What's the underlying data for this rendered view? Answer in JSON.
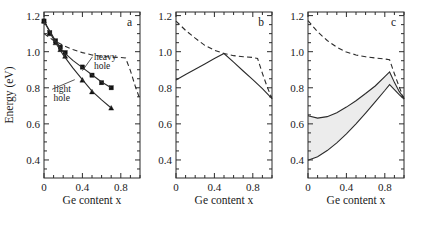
{
  "figure": {
    "background_color": "#ffffff",
    "ink_color": "#2b2b2b",
    "band_fill_color": "#ececec"
  },
  "chart_data": [
    {
      "type": "scatter",
      "panel": "a",
      "panel_label": "a",
      "title": "",
      "xlabel": "Ge content x",
      "ylabel": "Energy (eV)",
      "xlim": [
        0,
        1.0
      ],
      "ylim": [
        0.3,
        1.22
      ],
      "xticks": [
        0,
        0.4,
        0.8
      ],
      "xticklabels": [
        "0",
        "0.4",
        "0.8"
      ],
      "yticks": [
        0.4,
        0.6,
        0.8,
        1.0,
        1.2
      ],
      "yticklabels": [
        "0.4",
        "0.6",
        "0.8",
        "1.0",
        "1.2"
      ],
      "grid": false,
      "legend": "inline-annotations",
      "annotations": [
        {
          "text": "heavy hole",
          "x": 0.52,
          "y": 0.955,
          "points_to_x": 0.4,
          "points_to_y": 0.895
        },
        {
          "text": "light hole",
          "x": 0.1,
          "y": 0.775,
          "points_to_x": 0.32,
          "points_to_y": 0.845
        }
      ],
      "series": [
        {
          "name": "heavy hole data",
          "style": "markers",
          "marker": "filled-square",
          "x": [
            0.0,
            0.06,
            0.12,
            0.17,
            0.22,
            0.4,
            0.5,
            0.6,
            0.7
          ],
          "y": [
            1.17,
            1.105,
            1.06,
            1.025,
            0.995,
            0.915,
            0.87,
            0.828,
            0.8
          ]
        },
        {
          "name": "light hole data",
          "style": "markers",
          "marker": "filled-triangle",
          "x": [
            0.0,
            0.06,
            0.12,
            0.17,
            0.22,
            0.4,
            0.5,
            0.7
          ],
          "y": [
            1.17,
            1.1,
            1.05,
            1.012,
            0.975,
            0.843,
            0.778,
            0.688
          ]
        },
        {
          "name": "heavy hole fit",
          "style": "solid",
          "x": [
            0.0,
            0.1,
            0.2,
            0.3,
            0.4,
            0.5,
            0.6,
            0.7
          ],
          "y": [
            1.17,
            1.078,
            1.0,
            0.952,
            0.912,
            0.872,
            0.832,
            0.8
          ]
        },
        {
          "name": "light hole fit",
          "style": "solid",
          "x": [
            0.0,
            0.1,
            0.2,
            0.3,
            0.4,
            0.5,
            0.6,
            0.7
          ],
          "y": [
            1.17,
            1.068,
            0.982,
            0.91,
            0.845,
            0.782,
            0.733,
            0.688
          ]
        },
        {
          "name": "unstrained indirect gap",
          "style": "dashed",
          "x": [
            0.0,
            0.1,
            0.2,
            0.3,
            0.4,
            0.5,
            0.6,
            0.7,
            0.8,
            0.85,
            0.9,
            0.95,
            1.0
          ],
          "y": [
            1.1,
            1.062,
            1.035,
            1.012,
            0.995,
            0.982,
            0.975,
            0.97,
            0.968,
            0.965,
            0.895,
            0.81,
            0.735
          ]
        }
      ]
    },
    {
      "type": "line",
      "panel": "b",
      "panel_label": "b",
      "title": "",
      "xlabel": "Ge content x",
      "ylabel": "",
      "xlim": [
        0,
        1.0
      ],
      "ylim": [
        0.3,
        1.22
      ],
      "xticks": [
        0,
        0.4,
        0.8
      ],
      "xticklabels": [
        "0",
        "0.4",
        "0.8"
      ],
      "yticks": [
        0.4,
        0.6,
        0.8,
        1.0,
        1.2
      ],
      "yticklabels": [
        "0.4",
        "0.6",
        "0.8",
        "1.0",
        "1.2"
      ],
      "grid": false,
      "series": [
        {
          "name": "strained gap",
          "style": "solid",
          "x": [
            0.0,
            0.1,
            0.2,
            0.3,
            0.4,
            0.5,
            0.6,
            0.7,
            0.8,
            0.9,
            1.0
          ],
          "y": [
            0.843,
            0.874,
            0.903,
            0.932,
            0.962,
            0.99,
            0.942,
            0.893,
            0.845,
            0.795,
            0.74
          ]
        },
        {
          "name": "unstrained indirect gap",
          "style": "dashed",
          "x": [
            0.0,
            0.1,
            0.2,
            0.3,
            0.4,
            0.5,
            0.6,
            0.7,
            0.8,
            0.85,
            0.9,
            0.95,
            1.0
          ],
          "y": [
            1.17,
            1.118,
            1.075,
            1.035,
            1.008,
            0.99,
            0.978,
            0.972,
            0.968,
            0.962,
            0.88,
            0.805,
            0.74
          ]
        }
      ]
    },
    {
      "type": "area",
      "panel": "c",
      "panel_label": "c",
      "title": "",
      "xlabel": "Ge content x",
      "ylabel": "",
      "xlim": [
        0,
        1.0
      ],
      "ylim": [
        0.3,
        1.22
      ],
      "xticks": [
        0,
        0.4,
        0.8
      ],
      "xticklabels": [
        "0",
        "0.4",
        "0.8"
      ],
      "yticks": [
        0.4,
        0.6,
        0.8,
        1.0,
        1.2
      ],
      "yticklabels": [
        "0.4",
        "0.6",
        "0.8",
        "1.0",
        "1.2"
      ],
      "grid": false,
      "shaded_band": {
        "name": "confinement energy range",
        "fill": "#ececec",
        "upper_series": "band upper",
        "lower_series": "band lower"
      },
      "series": [
        {
          "name": "band upper",
          "style": "solid",
          "x": [
            0.0,
            0.1,
            0.2,
            0.3,
            0.4,
            0.5,
            0.6,
            0.7,
            0.8,
            0.85,
            0.9,
            0.95,
            1.0
          ],
          "y": [
            0.645,
            0.632,
            0.64,
            0.662,
            0.693,
            0.728,
            0.768,
            0.81,
            0.862,
            0.888,
            0.83,
            0.78,
            0.742
          ]
        },
        {
          "name": "band lower",
          "style": "solid",
          "x": [
            0.0,
            0.1,
            0.2,
            0.3,
            0.4,
            0.5,
            0.6,
            0.7,
            0.8,
            0.85,
            0.9,
            0.95,
            1.0
          ],
          "y": [
            0.398,
            0.418,
            0.452,
            0.495,
            0.545,
            0.6,
            0.66,
            0.722,
            0.785,
            0.818,
            0.79,
            0.762,
            0.738
          ]
        },
        {
          "name": "unstrained indirect gap",
          "style": "dashed",
          "x": [
            0.0,
            0.1,
            0.2,
            0.3,
            0.4,
            0.5,
            0.6,
            0.7,
            0.8,
            0.85,
            0.9,
            0.95,
            1.0
          ],
          "y": [
            1.172,
            1.11,
            1.062,
            1.025,
            0.998,
            0.982,
            0.972,
            0.965,
            0.96,
            0.955,
            0.878,
            0.805,
            0.738
          ]
        }
      ]
    }
  ]
}
